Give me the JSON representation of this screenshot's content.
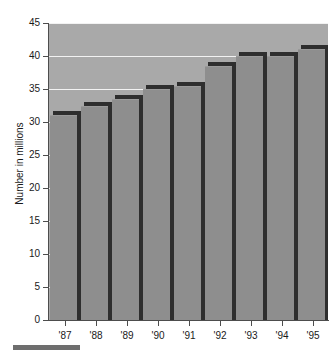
{
  "chart_data": {
    "type": "bar",
    "title": "",
    "xlabel": "",
    "ylabel": "Number in millions",
    "categories": [
      "'87",
      "'88",
      "'89",
      "'90",
      "'91",
      "'92",
      "'93",
      "'94",
      "'95"
    ],
    "values": [
      31,
      32.5,
      33.5,
      35,
      35.5,
      38.5,
      40,
      40,
      41
    ],
    "ylim": [
      0,
      45
    ],
    "ytick_labels": [
      "0",
      "5",
      "10",
      "15",
      "20",
      "25",
      "30",
      "35",
      "40",
      "45"
    ],
    "ytick_values": [
      0,
      5,
      10,
      15,
      20,
      25,
      30,
      35,
      40,
      45
    ],
    "ytick_step": 5,
    "grid": true,
    "gridlines_at": [
      5,
      10,
      15,
      20,
      25,
      30,
      35,
      40,
      45
    ],
    "legend": null,
    "series": [
      {
        "name": "Number in millions",
        "values": [
          31,
          32.5,
          33.5,
          35,
          35.5,
          38.5,
          40,
          40,
          41
        ]
      }
    ],
    "colors": {
      "plot_background": "#a9a9a9",
      "bar_fill": "#8e8e8e",
      "bar_shadow": "#2e2e2e",
      "gridline": "#f2f2f2",
      "axis": "#4d4d4d",
      "text": "#1a1a1a",
      "page_background": "#ffffff",
      "footer_rule": "#6e6e6e"
    }
  }
}
